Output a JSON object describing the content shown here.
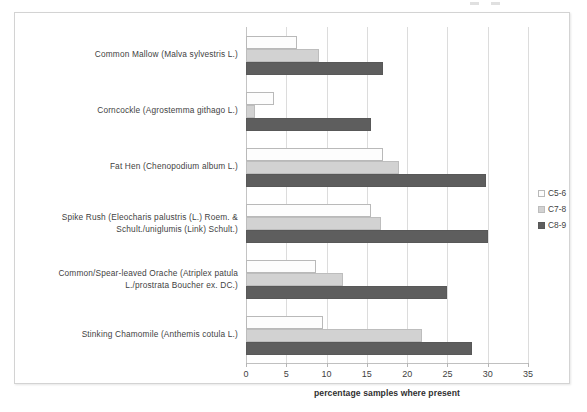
{
  "chart_data": {
    "type": "bar",
    "orientation": "horizontal",
    "title": "",
    "xlabel": "percentage samples where present",
    "ylabel": "",
    "xlim": [
      0,
      35
    ],
    "xticks": [
      0,
      5,
      10,
      15,
      20,
      25,
      30,
      35
    ],
    "grid": true,
    "legend_position": "right",
    "categories": [
      "Common Mallow (Malva sylvestris L.)",
      "Corncockle (Agrostemma githago L.)",
      "Fat Hen (Chenopodium album L.)",
      "Spike Rush (Eleocharis palustris (L.) Roem. & Schult./uniglumis (Link) Schult.)",
      "Common/Spear-leaved Orache (Atriplex patula L./prostrata Boucher ex. DC.)",
      "Stinking Chamomile (Anthemis cotula L.)"
    ],
    "series": [
      {
        "name": "C5-6",
        "color": "#fdfdfd",
        "values": [
          6.3,
          3.5,
          17.0,
          15.5,
          8.7,
          9.5
        ]
      },
      {
        "name": "C7-8",
        "color": "#d2d2d2",
        "values": [
          9.0,
          1.1,
          19.0,
          16.8,
          12.0,
          21.8
        ]
      },
      {
        "name": "C8-9",
        "color": "#5e5e5e",
        "values": [
          17.0,
          15.5,
          29.8,
          30.0,
          25.0,
          28.0
        ]
      }
    ]
  },
  "legend": {
    "items": [
      {
        "label": "C5-6"
      },
      {
        "label": "C7-8"
      },
      {
        "label": "C8-9"
      }
    ]
  }
}
